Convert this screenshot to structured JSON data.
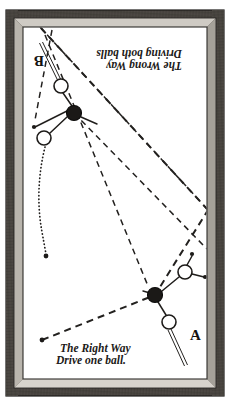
{
  "figure": {
    "name": "billiards-instruction-diagram",
    "medium": "engraved line drawing of a billiard table viewed from above, in a wooden picture frame",
    "colors": {
      "frame": "#3b3835",
      "frame_bevel": "#6e6a64",
      "cloth": "#ffffff",
      "ink": "#1b1917",
      "red_ball": "#1b1917"
    }
  },
  "captions": {
    "bottom": {
      "line1": "The Right Way",
      "line2": "Drive one ball.",
      "orientation": "upright",
      "x": 60,
      "y": 352
    },
    "top": {
      "line1": "The Wrong Way",
      "line2": "Driving both balls",
      "orientation": "rotated-180",
      "x": 145,
      "y": 60
    }
  },
  "labels": [
    {
      "id": "label-a",
      "text": "A",
      "x": 190,
      "y": 340,
      "rotation": 0
    },
    {
      "id": "label-b",
      "text": "B",
      "x": 44,
      "y": 66,
      "rotation": 180
    }
  ],
  "balls": [
    {
      "id": "ball-b-cue",
      "kind": "white",
      "cx": 61,
      "cy": 86,
      "r": 7.0
    },
    {
      "id": "ball-b-red",
      "kind": "red",
      "cx": 74,
      "cy": 113,
      "r": 7.5
    },
    {
      "id": "ball-b-object",
      "kind": "white",
      "cx": 44,
      "cy": 138,
      "r": 7.0
    },
    {
      "id": "ball-a-cue",
      "kind": "white",
      "cx": 169,
      "cy": 322,
      "r": 7.0
    },
    {
      "id": "ball-a-red",
      "kind": "red",
      "cx": 155,
      "cy": 295,
      "r": 7.5
    },
    {
      "id": "ball-a-object",
      "kind": "white",
      "cx": 185,
      "cy": 272,
      "r": 7.0
    }
  ],
  "cue_sticks": [
    {
      "id": "cue-stick-b",
      "x1": 41,
      "y1": 43,
      "x2": 59,
      "y2": 80,
      "note": "player B cue, double-ruled"
    },
    {
      "id": "cue-stick-a",
      "x1": 186,
      "y1": 364,
      "x2": 170,
      "y2": 329,
      "note": "player A cue, double-ruled"
    }
  ],
  "table": {
    "frame_rect": {
      "x": 6,
      "y": 10,
      "w": 218,
      "h": 386
    },
    "bevel_rect": {
      "x": 14,
      "y": 18,
      "w": 202,
      "h": 370
    },
    "cloth_rect": {
      "x": 23,
      "y": 27,
      "w": 184,
      "h": 352
    }
  },
  "trajectories": [
    {
      "id": "aim-line-a-long",
      "style": "long-dash",
      "description": "A's long dashed aim line running from lower-left corner up to the upper-right rail",
      "points": "42,340 155,295 208,210"
    },
    {
      "id": "aim-line-a-return",
      "style": "long-dash",
      "description": "dashed line rebounding from right rail back to upper-left corner",
      "points": "208,210 40,27"
    },
    {
      "id": "aim-line-b-outgoing",
      "style": "long-dash",
      "description": "B's dashed aim line from top-left corner down to the right rail",
      "points": "40,27 208,210"
    },
    {
      "id": "aim-line-b-second",
      "style": "long-dash",
      "description": "second dashed line from the upper area down through the table to the right rail",
      "points": "74,113 207,249"
    },
    {
      "id": "aim-line-b-third",
      "style": "long-dash",
      "description": "dashed line from upper-left down the left of the group",
      "points": "45,35 148,286"
    },
    {
      "id": "ball-path-dotted",
      "style": "dotted",
      "description": "dotted curving path of the driven ball ending in a dot",
      "points": "45,147 38,190 43,228 46,255"
    }
  ],
  "connectors": [
    {
      "id": "link-b-cue-to-red",
      "x1": 63,
      "y1": 93,
      "x2": 72,
      "y2": 106
    },
    {
      "id": "link-b-red-to-obj",
      "x1": 67,
      "y1": 116,
      "x2": 50,
      "y2": 134
    },
    {
      "id": "link-b-red-left",
      "x1": 67,
      "y1": 113,
      "x2": 35,
      "y2": 127
    },
    {
      "id": "link-b-red-right",
      "x1": 81,
      "y1": 117,
      "x2": 97,
      "y2": 124
    },
    {
      "id": "link-a-cue-to-red",
      "x1": 166,
      "y1": 315,
      "x2": 158,
      "y2": 302
    },
    {
      "id": "link-a-red-to-obj",
      "x1": 162,
      "y1": 291,
      "x2": 179,
      "y2": 277
    },
    {
      "id": "link-a-obj-up",
      "x1": 187,
      "y1": 265,
      "x2": 192,
      "y2": 255
    },
    {
      "id": "link-a-obj-right",
      "x1": 192,
      "y1": 274,
      "x2": 204,
      "y2": 277
    }
  ],
  "endpoints": [
    {
      "id": "endpoint-dotted-path",
      "cx": 46,
      "cy": 256,
      "r": 2.3
    },
    {
      "id": "endpoint-aim-lower-left",
      "cx": 42,
      "cy": 340,
      "r": 2.3
    },
    {
      "id": "endpoint-a-obj-up",
      "cx": 192,
      "cy": 254,
      "r": 2.1
    },
    {
      "id": "endpoint-a-obj-right",
      "cx": 205,
      "cy": 277,
      "r": 2.1
    },
    {
      "id": "endpoint-b-red-left",
      "cx": 34,
      "cy": 127,
      "r": 2.1
    }
  ]
}
